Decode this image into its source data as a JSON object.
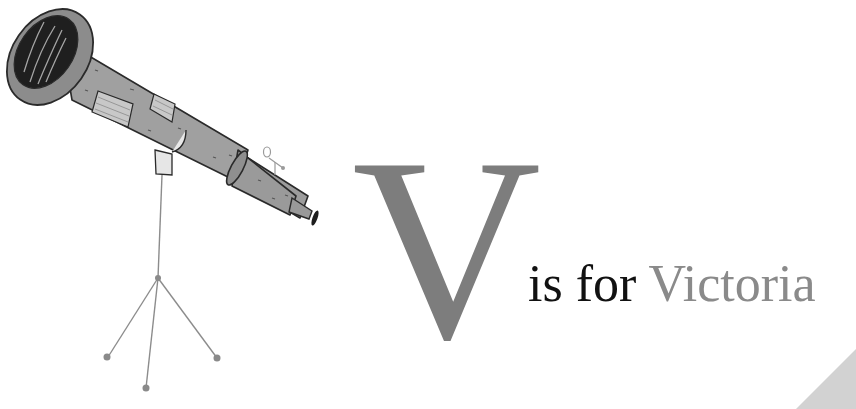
{
  "page": {
    "background": "#ffffff"
  },
  "illustration": {
    "subject": "telescope-on-tripod",
    "colors": {
      "tube": "#9a9a9a",
      "outline": "#2a2a2a",
      "lens_dark": "#1e1e1e",
      "tripod": "#8c8c8c"
    }
  },
  "heading": {
    "letter": "V",
    "letter_color": "#7d7d7d",
    "lead_text": "is for",
    "lead_color": "#111111",
    "word": "Victoria",
    "word_color": "#8a8a8a"
  },
  "corner": {
    "color": "#d2d2d2"
  }
}
